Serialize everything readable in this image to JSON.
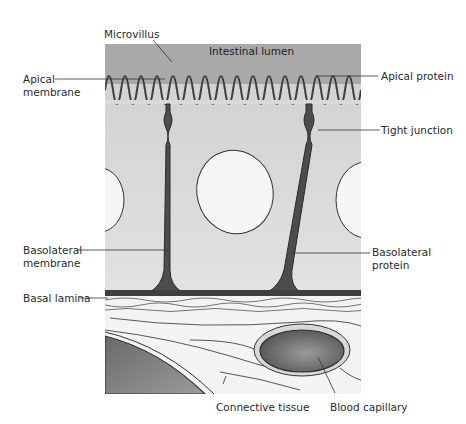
{
  "figure": {
    "colors": {
      "lumen": "#a9a9a9",
      "cytoplasm": "#dcdcdc",
      "nucleus": "#f4f4f4",
      "membrane": "#4a4a4a",
      "connective": "#f2f2f2",
      "capillary": "#7a7a7a"
    }
  },
  "labels": {
    "microvillus": "Microvillus",
    "intestinal_lumen": "Intestinal lumen",
    "apical_membrane_1": "Apical",
    "apical_membrane_2": "membrane",
    "apical_protein": "Apical protein",
    "tight_junction": "Tight junction",
    "basolateral_membrane_1": "Basolateral",
    "basolateral_membrane_2": "membrane",
    "basolateral_protein_1": "Basolateral",
    "basolateral_protein_2": "protein",
    "basal_lamina": "Basal lamina",
    "connective_tissue": "Connective tissue",
    "blood_capillary": "Blood capillary"
  }
}
